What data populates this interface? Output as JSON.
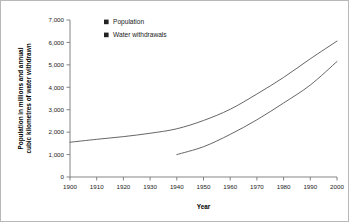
{
  "chart_data": {
    "type": "line",
    "title": "",
    "xlabel": "Year",
    "ylabel": "Population in millions and annual cubic kilometres of water withdrawn",
    "ylabel_lines": [
      "Population in millions and annual",
      "cubic kilometres of water withdrawn"
    ],
    "xlim": [
      1900,
      2000
    ],
    "ylim": [
      0,
      7000
    ],
    "xticks": [
      1900,
      1910,
      1920,
      1930,
      1940,
      1950,
      1960,
      1970,
      1980,
      1990,
      2000
    ],
    "xtick_labels": [
      "1900",
      "1910",
      "1920",
      "1930",
      "1940",
      "1950",
      "1960",
      "1970",
      "1980",
      "1990",
      "2000"
    ],
    "yticks": [
      0,
      1000,
      2000,
      3000,
      4000,
      5000,
      6000,
      7000
    ],
    "ytick_labels": [
      "0",
      "1,000",
      "2,000",
      "3,000",
      "4,000",
      "5,000",
      "6,000",
      "7,000"
    ],
    "grid": false,
    "legend_position": "top-left-inside",
    "line_color": "#555555",
    "marker_color": "#222222",
    "series": [
      {
        "name": "Population",
        "x": [
          1900,
          1910,
          1920,
          1930,
          1940,
          1950,
          1960,
          1970,
          1980,
          1990,
          2000
        ],
        "values": [
          1550,
          1680,
          1800,
          1950,
          2150,
          2520,
          3020,
          3700,
          4440,
          5270,
          6060
        ]
      },
      {
        "name": "Water withdrawals",
        "x": [
          1940,
          1950,
          1960,
          1970,
          1980,
          1990,
          2000
        ],
        "values": [
          1000,
          1350,
          1900,
          2550,
          3300,
          4100,
          5150
        ]
      }
    ]
  },
  "legend": {
    "items": [
      {
        "label": "Population"
      },
      {
        "label": "Water withdrawals"
      }
    ]
  }
}
